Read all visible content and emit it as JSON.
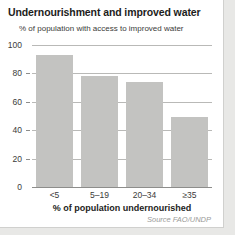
{
  "chart_data": {
    "type": "bar",
    "title": "Undernourishment and improved water",
    "subtitle": "% of population with access to improved water",
    "xlabel": "% of population undernourished",
    "ylabel": "% of population with access to improved water",
    "categories": [
      "<5",
      "5–19",
      "20–34",
      "≥35"
    ],
    "values": [
      93,
      78,
      74,
      49
    ],
    "ylim": [
      0,
      100
    ],
    "yticks": [
      0,
      20,
      40,
      60,
      80,
      100
    ],
    "ytick_labels": [
      "0",
      "20",
      "40",
      "60",
      "80",
      "100"
    ],
    "grid": true,
    "legend": "none",
    "source": "Source FAO/UNDP",
    "bar_color": "#c3c3c1",
    "grid_color": "#b9b9b7",
    "text_color": "#1d1d1b",
    "background": "#ffffff"
  }
}
